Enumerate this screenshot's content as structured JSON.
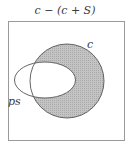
{
  "diagram": {
    "type": "venn",
    "title": "c − (c + S)",
    "sets": [
      {
        "id": "c",
        "label": "c",
        "shape": "circle",
        "shaded": true
      },
      {
        "id": "ps",
        "label": "ps",
        "shape": "ellipse",
        "shaded": false
      }
    ],
    "shaded_region": "c minus ps",
    "colors": {
      "shade": "#b9b9b9",
      "outline": "#555555",
      "frame": "#9a9a9a",
      "background": "#ffffff"
    }
  }
}
